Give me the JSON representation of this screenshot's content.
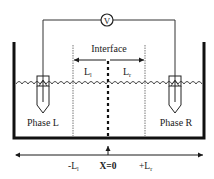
{
  "diagram": {
    "voltmeter": {
      "symbol": "V"
    },
    "interface_label": "Interface",
    "left_length": {
      "base": "L",
      "sub": "l"
    },
    "right_length": {
      "base": "L",
      "sub": "r"
    },
    "phase_left": "Phase L",
    "phase_right": "Phase R",
    "axis": {
      "left": {
        "base": "-L",
        "sub": "l"
      },
      "center": "X=0",
      "right": {
        "base": "+L",
        "sub": "r"
      }
    },
    "colors": {
      "line": "#1a1a1a",
      "wall": "#111111",
      "dotted": "#777777"
    }
  }
}
